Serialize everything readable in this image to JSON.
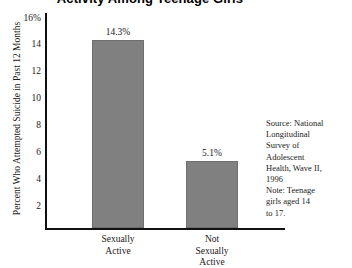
{
  "chart_data": {
    "type": "bar",
    "title": "Activity Among Teenage Girls",
    "xlabel": "",
    "ylabel": "Percent Who Attempted Suicide in Past 12 Months",
    "categories": [
      "Sexually Active",
      "Not Sexually Active"
    ],
    "values": [
      14.3,
      5.1
    ],
    "value_labels": [
      "14.3%",
      "5.1%"
    ],
    "ylim": [
      0,
      16
    ],
    "yticks": [
      16,
      14,
      12,
      10,
      8,
      6,
      4,
      2
    ],
    "ytick_labels": [
      "16%",
      "14",
      "12",
      "10",
      "8",
      "6",
      "4",
      "2"
    ],
    "grid": false,
    "legend": false,
    "bar_color": "#808080",
    "axis_color": "#111111",
    "category_lines": [
      [
        "Sexually",
        "Active"
      ],
      [
        "Not",
        "Sexually",
        "Active"
      ]
    ],
    "annotation_lines": [
      "Source: National",
      "Longitudinal",
      "Survey of",
      "Adolescent",
      "Health, Wave II,",
      "1996",
      "Note: Teenage",
      "girls aged 14",
      "to 17."
    ]
  }
}
